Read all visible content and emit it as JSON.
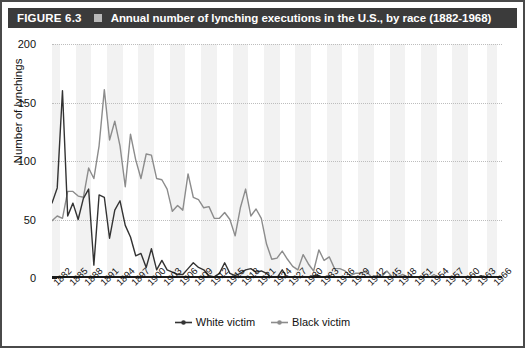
{
  "figure": {
    "label": "FIGURE 6.3",
    "bullet_icon": "square-bullet-icon",
    "title": "Annual number of lynching executions in the U.S., by race (1882-1968)"
  },
  "colors": {
    "title_bar_bg": "#3b3b3b",
    "title_text": "#ffffff",
    "white_victim_series": "#333333",
    "black_victim_series": "#8c8c8c",
    "band": "#f2f2f2",
    "grid": "#bdbdbd",
    "axis": "#1a1a1a"
  },
  "chart_data": {
    "type": "line",
    "title": "Annual number of lynching executions in the U.S., by race (1882-1968)",
    "xlabel": "",
    "ylabel": "Number of lynchings",
    "ylim": [
      0,
      200
    ],
    "yticks": [
      0,
      50,
      100,
      150,
      200
    ],
    "xlim": [
      1882,
      1968
    ],
    "xtick_labels": [
      "1882",
      "1885",
      "1888",
      "1891",
      "1894",
      "1897",
      "1900",
      "1903",
      "1906",
      "1909",
      "1912",
      "1915",
      "1918",
      "1921",
      "1924",
      "1927",
      "1930",
      "1933",
      "1936",
      "1939",
      "1942",
      "1945",
      "1948",
      "1951",
      "1954",
      "1957",
      "1960",
      "1963",
      "1966"
    ],
    "grid": "horizontal-dotted",
    "legend_position": "bottom-center",
    "x": [
      1882,
      1883,
      1884,
      1885,
      1886,
      1887,
      1888,
      1889,
      1890,
      1891,
      1892,
      1893,
      1894,
      1895,
      1896,
      1897,
      1898,
      1899,
      1900,
      1901,
      1902,
      1903,
      1904,
      1905,
      1906,
      1907,
      1908,
      1909,
      1910,
      1911,
      1912,
      1913,
      1914,
      1915,
      1916,
      1917,
      1918,
      1919,
      1920,
      1921,
      1922,
      1923,
      1924,
      1925,
      1926,
      1927,
      1928,
      1929,
      1930,
      1931,
      1932,
      1933,
      1934,
      1935,
      1936,
      1937,
      1938,
      1939,
      1940,
      1941,
      1942,
      1943,
      1944,
      1945,
      1946,
      1947,
      1948,
      1949,
      1950,
      1951,
      1952,
      1953,
      1954,
      1955,
      1956,
      1957,
      1958,
      1959,
      1960,
      1961,
      1962,
      1963,
      1964,
      1965,
      1966,
      1967,
      1968
    ],
    "series": [
      {
        "name": "White victim",
        "color": "#333333",
        "marker": "dot",
        "values": [
          64,
          77,
          160,
          53,
          64,
          50,
          68,
          76,
          11,
          71,
          69,
          34,
          58,
          66,
          45,
          35,
          19,
          21,
          9,
          25,
          7,
          15,
          7,
          5,
          3,
          3,
          8,
          13,
          9,
          7,
          2,
          1,
          4,
          13,
          4,
          2,
          4,
          7,
          8,
          5,
          6,
          4,
          0,
          0,
          7,
          0,
          1,
          1,
          1,
          1,
          2,
          2,
          0,
          2,
          0,
          0,
          0,
          1,
          1,
          0,
          0,
          0,
          0,
          0,
          0,
          1,
          1,
          0,
          1,
          1,
          0,
          0,
          0,
          0,
          0,
          1,
          0,
          0,
          0,
          0,
          0,
          0,
          2,
          0,
          0,
          0,
          0
        ]
      },
      {
        "name": "Black victim",
        "color": "#8c8c8c",
        "marker": "dot",
        "values": [
          49,
          53,
          51,
          74,
          74,
          70,
          69,
          94,
          85,
          113,
          161,
          118,
          134,
          113,
          78,
          123,
          101,
          85,
          106,
          105,
          85,
          84,
          76,
          57,
          62,
          58,
          89,
          69,
          67,
          60,
          61,
          51,
          51,
          56,
          50,
          36,
          60,
          76,
          53,
          59,
          51,
          29,
          16,
          17,
          23,
          16,
          10,
          7,
          20,
          12,
          6,
          24,
          15,
          18,
          8,
          8,
          6,
          2,
          4,
          4,
          6,
          1,
          2,
          1,
          6,
          1,
          1,
          3,
          1,
          1,
          0,
          0,
          0,
          3,
          0,
          1,
          0,
          0,
          0,
          1,
          1,
          0,
          1,
          0,
          0,
          0,
          0
        ]
      }
    ]
  },
  "legend": [
    {
      "label": "White victim",
      "icon": "line-dot-marker-icon"
    },
    {
      "label": "Black victim",
      "icon": "line-dot-marker-icon"
    }
  ]
}
